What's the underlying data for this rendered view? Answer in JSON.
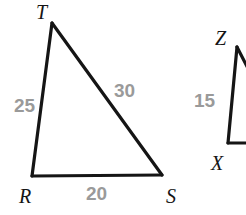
{
  "figure": {
    "kind": "geometry-diagram",
    "background_color": "#ffffff",
    "stroke_color": "#151515",
    "stroke_width": 3,
    "vertex_label_color": "#151515",
    "side_label_color": "#9a9a9a",
    "canvas": {
      "width": 246,
      "height": 215
    }
  },
  "triangles": [
    {
      "name": "triangle-rst",
      "vertices": [
        {
          "name": "T",
          "label": "T",
          "x": 52,
          "y": 23,
          "label_x": 36,
          "label_y": 2
        },
        {
          "name": "R",
          "label": "R",
          "x": 32,
          "y": 176,
          "label_x": 19,
          "label_y": 186
        },
        {
          "name": "S",
          "label": "S",
          "x": 162,
          "y": 175,
          "label_x": 166,
          "label_y": 186
        }
      ],
      "sides": [
        {
          "name": "RT",
          "value": "25",
          "label_x": 14,
          "label_y": 96
        },
        {
          "name": "TS",
          "value": "30",
          "label_x": 114,
          "label_y": 81
        },
        {
          "name": "RS",
          "value": "20",
          "label_x": 86,
          "label_y": 184
        }
      ]
    },
    {
      "name": "triangle-xyz-cropped",
      "vertices": [
        {
          "name": "Z",
          "label": "Z",
          "x": 237,
          "y": 47,
          "label_x": 215,
          "label_y": 28
        },
        {
          "name": "X",
          "label": "X",
          "x": 228,
          "y": 143,
          "label_x": 211,
          "label_y": 153
        }
      ],
      "sides": [
        {
          "name": "XZ",
          "value": "15",
          "label_x": 194,
          "label_y": 91
        }
      ]
    }
  ]
}
